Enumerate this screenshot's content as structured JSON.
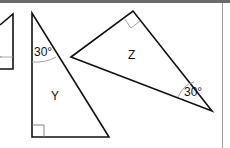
{
  "diagram": {
    "triangles": [
      {
        "id": "partial",
        "label": "",
        "right_angle": true
      },
      {
        "id": "Y",
        "label": "Y",
        "angle_label": "30°",
        "right_angle": true
      },
      {
        "id": "Z",
        "label": "Z",
        "angle_label": "30°",
        "right_angle": true
      }
    ]
  },
  "labels": {
    "y": "Y",
    "z": "Z",
    "y_angle": "30°",
    "z_angle": "30°"
  },
  "colors": {
    "stroke": "#111111",
    "arc": "#888888",
    "topbar": "#6b6b6b",
    "border": "#9a9a9a"
  }
}
